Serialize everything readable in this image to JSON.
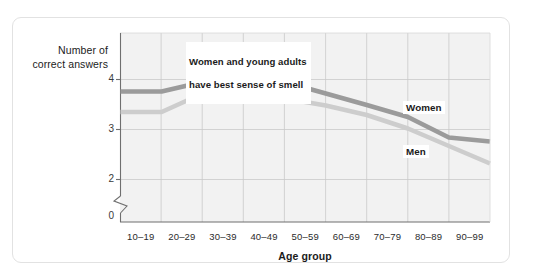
{
  "chart_data": {
    "type": "line",
    "title": "",
    "subtitle": "",
    "xlabel": "Age group",
    "ylabel": "Number of\ncorrect answers",
    "ylabel_line1": "Number of",
    "ylabel_line2": "correct answers",
    "categories": [
      "10–19",
      "20–29",
      "30–39",
      "40–49",
      "50–59",
      "60–69",
      "70–79",
      "80–89",
      "90–99"
    ],
    "yticks": [
      "0",
      "2",
      "3",
      "4"
    ],
    "ytick_values": [
      0,
      2,
      3,
      4
    ],
    "ylim": [
      1.85,
      4.3
    ],
    "axis_break": true,
    "grid": true,
    "legend_position": "inline",
    "series": [
      {
        "name": "Women",
        "color": "#9b9b9b",
        "values": [
          3.76,
          3.95,
          3.93,
          3.95,
          3.72,
          3.49,
          3.25,
          2.84,
          2.76
        ]
      },
      {
        "name": "Men",
        "color": "#cdcdcd",
        "values": [
          3.35,
          3.72,
          3.73,
          3.62,
          3.48,
          3.29,
          3.02,
          2.67,
          2.32
        ]
      }
    ],
    "annotations": [
      {
        "id": "callout-best-smell",
        "text": "Women and young adults\nhave best sense of smell"
      }
    ]
  },
  "annotation": {
    "line1": "Women and young adults",
    "line2": "have best sense of smell",
    "text": "Women and young adults\nhave best sense of smell"
  },
  "axes": {
    "y_title_line1": "Number of",
    "y_title_line2": "correct answers",
    "x_title": "Age group"
  },
  "legend": {
    "women": "Women",
    "men": "Men"
  },
  "ticks": {
    "y": [
      "0",
      "2",
      "3",
      "4"
    ],
    "x": [
      "10–19",
      "20–29",
      "30–39",
      "40–49",
      "50–59",
      "60–69",
      "70–79",
      "80–89",
      "90–99"
    ]
  },
  "colors": {
    "women_line": "#9b9b9b",
    "men_line": "#cdcdcd",
    "plot_background": "#f2f2f2",
    "gridline": "#c9c9c9",
    "axis": "#6f6f6f",
    "card_border": "#e2e2e2"
  }
}
